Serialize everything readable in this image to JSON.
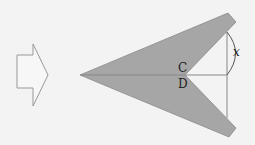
{
  "diagram": {
    "labels": {
      "point_c": "C",
      "point_d": "D",
      "angle": "x"
    },
    "colors": {
      "background": "#f3f3f3",
      "shape_fill": "#a6a6a6",
      "outline": "#8a8a8a",
      "text": "#222222"
    }
  }
}
